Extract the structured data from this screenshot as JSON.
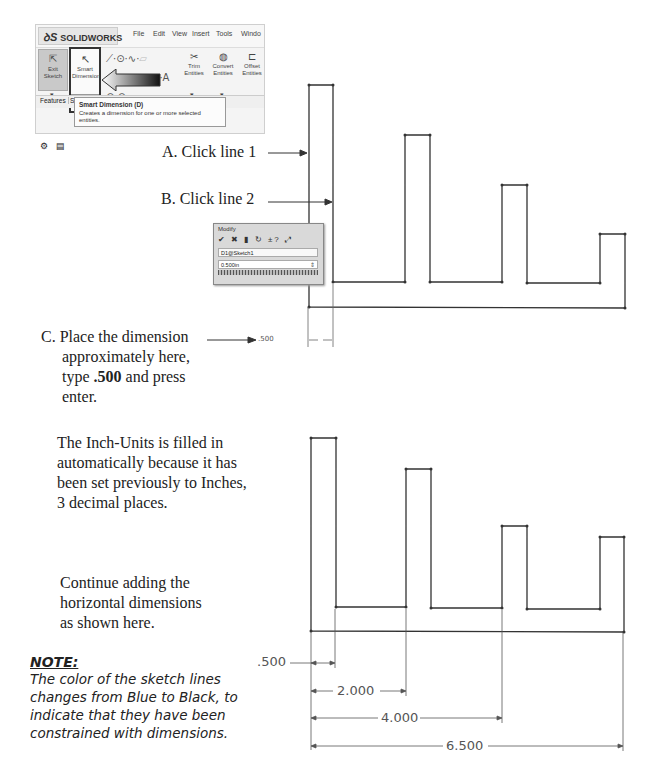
{
  "toolbar": {
    "logo_ds": "ꝺS",
    "logo_text": "SOLIDWORKS",
    "menu": [
      "File",
      "Edit",
      "View",
      "Insert",
      "Tools",
      "Windo"
    ],
    "exit_sketch": "Exit Sketch",
    "smart_dimension": "Smart Dimension",
    "trim": "Trim Entities",
    "convert": "Convert Entities",
    "offset": "Offset Entities",
    "tab_features": "Features",
    "tab_s": "S",
    "tooltip_title": "Smart Dimension   (D)",
    "tooltip_body": "Creates a dimension for one or more selected entities."
  },
  "modify_dialog": {
    "title": "Modify",
    "icons": "✔ ✖ ▮ ↻ ±? ⤢",
    "name": "D1@Sketch1",
    "value": "0.500in"
  },
  "instructions": {
    "a": "A. Click line 1",
    "b": "B. Click line 2",
    "c_line1": "C. Place the dimension",
    "c_line2": "approximately here,",
    "c_line3_pre": "type ",
    "c_line3_bold": ".500",
    "c_line3_post": " and press",
    "c_line4": "enter.",
    "inch_units": [
      "The Inch-Units is filled in",
      "automatically because it has",
      "been set previously to Inches,",
      "3 decimal places."
    ],
    "continue": [
      "Continue adding the",
      "horizontal dimensions",
      "as shown here."
    ]
  },
  "note": {
    "title": "NOTE:",
    "body": [
      "The color of the sketch lines",
      "changes from Blue to Black, to",
      "indicate that they have been",
      "constrained with dimensions."
    ]
  },
  "dimensions": {
    "preview": ".500",
    "d1": ".500",
    "d2": "2.000",
    "d3": "4.000",
    "d4": "6.500"
  }
}
